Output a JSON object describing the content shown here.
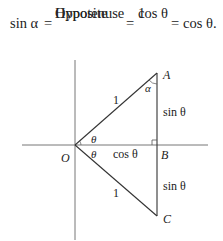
{
  "equation": {
    "lhs": "sin α",
    "eq1": "=",
    "frac1": {
      "numerator": "Opposite",
      "denominator": "Hypotenuse"
    },
    "eq2": "=",
    "frac2": {
      "numerator": "cos θ",
      "denominator": "1"
    },
    "eq3": "=",
    "rhs": "cos θ."
  },
  "diagram": {
    "points": {
      "O": "O",
      "A": "A",
      "B": "B",
      "C": "C"
    },
    "labels": {
      "hyp_upper": "1",
      "hyp_lower": "1",
      "alpha": "α",
      "theta_upper": "θ",
      "theta_lower": "θ",
      "adjacent": "cos θ",
      "side_upper": "sin θ",
      "side_lower": "sin θ"
    }
  }
}
